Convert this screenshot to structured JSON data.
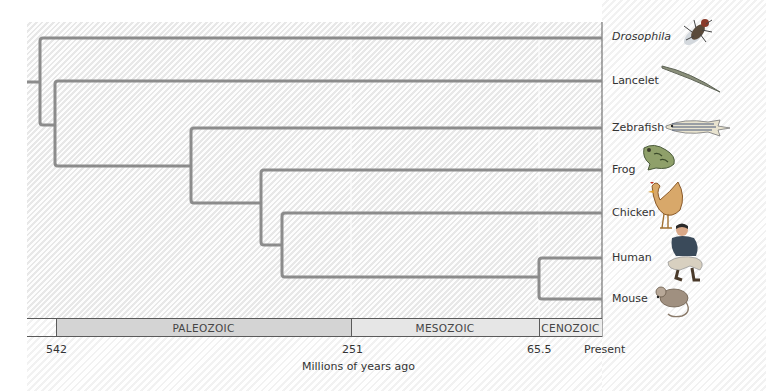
{
  "diagram": {
    "type": "phylogenetic-tree",
    "taxa": [
      {
        "label": "Drosophila",
        "italic": true,
        "icon": "fruit-fly-icon"
      },
      {
        "label": "Lancelet",
        "italic": false,
        "icon": "lancelet-icon"
      },
      {
        "label": "Zebrafish",
        "italic": false,
        "icon": "zebrafish-icon"
      },
      {
        "label": "Frog",
        "italic": false,
        "icon": "frog-icon"
      },
      {
        "label": "Chicken",
        "italic": false,
        "icon": "chicken-icon"
      },
      {
        "label": "Human",
        "italic": false,
        "icon": "human-icon"
      },
      {
        "label": "Mouse",
        "italic": false,
        "icon": "mouse-icon"
      }
    ],
    "eras": [
      {
        "label": "PALEOZOIC"
      },
      {
        "label": "MESOZOIC"
      },
      {
        "label": "CENOZOIC"
      }
    ],
    "axis": {
      "ticks": [
        "542",
        "251",
        "65.5",
        "Present"
      ],
      "title": "Millions of years ago"
    },
    "colors": {
      "branch": "#8c8c8c",
      "paleozoic_fill": "#d4d4d4",
      "mesozoic_fill": "#e6e6e6",
      "cenozoic_fill": "#ececec",
      "border": "#5a5a5a"
    }
  }
}
